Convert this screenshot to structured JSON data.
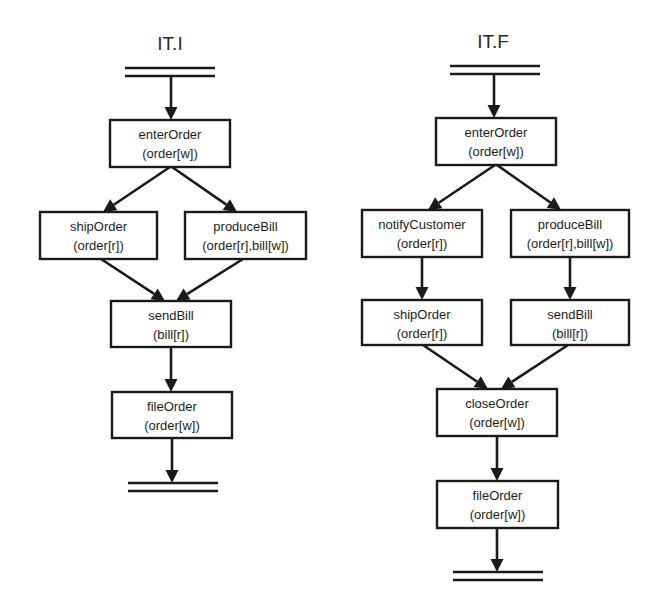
{
  "diagrams": [
    {
      "id": "it-i",
      "title": "IT.I",
      "title_pos": [
        170,
        50
      ],
      "start_bar": {
        "x1": 125,
        "x2": 215,
        "y": 68
      },
      "end_bar": {
        "x1": 128,
        "x2": 218,
        "y": 483
      },
      "nodes": [
        {
          "key": "enterOrder",
          "name": "enterOrder",
          "args": "(order[w])",
          "x": 110,
          "y": 120,
          "w": 120,
          "h": 47
        },
        {
          "key": "shipOrder",
          "name": "shipOrder",
          "args": "(order[r])",
          "x": 40,
          "y": 212,
          "w": 117,
          "h": 47
        },
        {
          "key": "produceBill",
          "name": "produceBill",
          "args": "(order[r],bill[w])",
          "x": 185,
          "y": 212,
          "w": 121,
          "h": 47
        },
        {
          "key": "sendBill",
          "name": "sendBill",
          "args": "(bill[r])",
          "x": 111,
          "y": 301,
          "w": 120,
          "h": 46
        },
        {
          "key": "fileOrder",
          "name": "fileOrder",
          "args": "(order[w])",
          "x": 112,
          "y": 392,
          "w": 120,
          "h": 46
        }
      ],
      "edges": [
        {
          "from": [
            171,
            76
          ],
          "to": [
            171,
            120
          ]
        },
        {
          "from": [
            170,
            167
          ],
          "to": [
            103,
            212
          ]
        },
        {
          "from": [
            172,
            167
          ],
          "to": [
            237,
            212
          ]
        },
        {
          "from": [
            101,
            259
          ],
          "to": [
            165,
            301
          ]
        },
        {
          "from": [
            243,
            259
          ],
          "to": [
            176,
            301
          ]
        },
        {
          "from": [
            171,
            347
          ],
          "to": [
            171,
            392
          ]
        },
        {
          "from": [
            172,
            438
          ],
          "to": [
            172,
            483
          ]
        }
      ]
    },
    {
      "id": "it-f",
      "title": "IT.F",
      "title_pos": [
        493,
        48
      ],
      "start_bar": {
        "x1": 450,
        "x2": 540,
        "y": 66
      },
      "end_bar": {
        "x1": 453,
        "x2": 543,
        "y": 572
      },
      "nodes": [
        {
          "key": "enterOrder",
          "name": "enterOrder",
          "args": "(order[w])",
          "x": 436,
          "y": 118,
          "w": 120,
          "h": 47
        },
        {
          "key": "notifyCustomer",
          "name": "notifyCustomer",
          "args": "(order[r])",
          "x": 362,
          "y": 210,
          "w": 120,
          "h": 47
        },
        {
          "key": "produceBill",
          "name": "produceBill",
          "args": "(order[r],bill[w])",
          "x": 511,
          "y": 210,
          "w": 118,
          "h": 47
        },
        {
          "key": "shipOrder",
          "name": "shipOrder",
          "args": "(order[r])",
          "x": 362,
          "y": 300,
          "w": 120,
          "h": 45
        },
        {
          "key": "sendBill",
          "name": "sendBill",
          "args": "(bill[r])",
          "x": 511,
          "y": 300,
          "w": 118,
          "h": 45
        },
        {
          "key": "closeOrder",
          "name": "closeOrder",
          "args": "(order[w])",
          "x": 437,
          "y": 389,
          "w": 120,
          "h": 47
        },
        {
          "key": "fileOrder",
          "name": "fileOrder",
          "args": "(order[w])",
          "x": 437,
          "y": 481,
          "w": 121,
          "h": 47
        }
      ],
      "edges": [
        {
          "from": [
            494,
            74
          ],
          "to": [
            494,
            118
          ]
        },
        {
          "from": [
            495,
            165
          ],
          "to": [
            428,
            210
          ]
        },
        {
          "from": [
            497,
            165
          ],
          "to": [
            561,
            210
          ]
        },
        {
          "from": [
            422,
            257
          ],
          "to": [
            422,
            300
          ]
        },
        {
          "from": [
            570,
            257
          ],
          "to": [
            570,
            300
          ]
        },
        {
          "from": [
            423,
            345
          ],
          "to": [
            488,
            389
          ]
        },
        {
          "from": [
            568,
            345
          ],
          "to": [
            501,
            389
          ]
        },
        {
          "from": [
            497,
            436
          ],
          "to": [
            497,
            481
          ]
        },
        {
          "from": [
            497,
            528
          ],
          "to": [
            497,
            572
          ]
        }
      ]
    }
  ]
}
